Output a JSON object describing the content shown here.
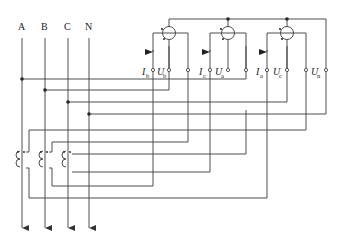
{
  "diagram": {
    "type": "three-phase four-wire energy meter wiring with current transformers",
    "phases": [
      {
        "label": "A",
        "x": 22
      },
      {
        "label": "B",
        "x": 45
      },
      {
        "label": "C",
        "x": 68
      },
      {
        "label": "N",
        "x": 89
      }
    ],
    "meters": [
      {
        "current_label": "I",
        "current_sub": "b",
        "voltage_label": "U",
        "voltage_sub": "b",
        "cx": 169
      },
      {
        "current_label": "I",
        "current_sub": "c",
        "voltage_label": "U",
        "voltage_sub": "a",
        "cx": 228
      },
      {
        "current_label": "I",
        "current_sub": "a",
        "voltage_label": "U",
        "voltage_sub": "c",
        "cx": 287
      }
    ],
    "neutral_terminal": {
      "label": "U",
      "sub": "n"
    },
    "current_transformers": 3,
    "colors": {
      "line": "#3a3a3a",
      "background": "#ffffff"
    }
  }
}
